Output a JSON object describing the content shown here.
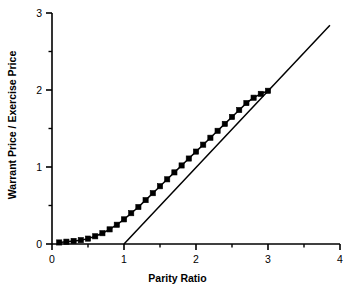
{
  "chart_data": {
    "type": "line",
    "title": "",
    "xlabel": "Parity Ratio",
    "ylabel": "Warrant Price / Exercise Price",
    "xlim": [
      0,
      4
    ],
    "ylim": [
      0,
      3
    ],
    "grid": false,
    "legend": "none",
    "x_major_ticks": [
      0,
      1,
      2,
      3,
      4
    ],
    "x_minor_ticks": [
      0.5,
      1.5,
      2.5,
      3.5
    ],
    "x_tick_labels": [
      "0",
      "1",
      "2",
      "3",
      "4"
    ],
    "y_major_ticks": [
      0,
      1,
      2,
      3
    ],
    "y_minor_ticks": [
      0.5,
      1.5,
      2.5
    ],
    "y_tick_labels": [
      "0",
      "1",
      "2",
      "3"
    ],
    "series": [
      {
        "name": "Warrant Price Curve",
        "marker": "filled-square",
        "color": "#000000",
        "x": [
          0.1,
          0.2,
          0.3,
          0.4,
          0.5,
          0.6,
          0.7,
          0.8,
          0.9,
          1.0,
          1.1,
          1.2,
          1.3,
          1.4,
          1.5,
          1.6,
          1.7,
          1.8,
          1.9,
          2.0,
          2.1,
          2.2,
          2.3,
          2.4,
          2.5,
          2.6,
          2.7,
          2.8,
          2.9,
          3.0
        ],
        "values": [
          0.02,
          0.03,
          0.04,
          0.05,
          0.07,
          0.1,
          0.14,
          0.19,
          0.25,
          0.32,
          0.4,
          0.48,
          0.57,
          0.66,
          0.75,
          0.84,
          0.93,
          1.02,
          1.11,
          1.2,
          1.29,
          1.38,
          1.47,
          1.56,
          1.65,
          1.74,
          1.83,
          1.9,
          1.95,
          1.99
        ]
      },
      {
        "name": "Intrinsic Value Line",
        "marker": "none",
        "color": "#000000",
        "x": [
          1.0,
          3.86
        ],
        "values": [
          0.0,
          2.84
        ]
      }
    ],
    "annotations": []
  },
  "axes": {
    "x_axis_name": "x-axis",
    "y_axis_name": "y-axis"
  }
}
